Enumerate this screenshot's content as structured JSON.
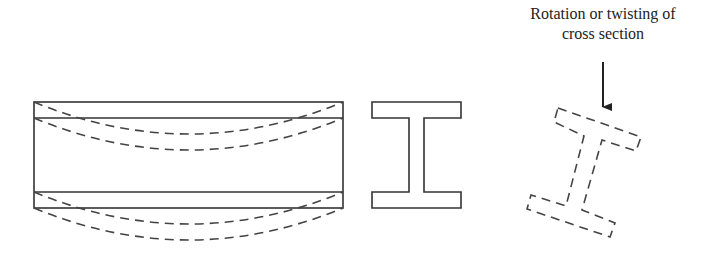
{
  "figure": {
    "annotation": {
      "line1": "Rotation or twisting of",
      "line2": "cross section"
    },
    "parts": [
      {
        "name": "beam-side-view",
        "style": "solid outline with dashed deflected flange curves"
      },
      {
        "name": "original-cross-section",
        "style": "solid I-shape"
      },
      {
        "name": "twisted-cross-section",
        "style": "dashed rotated I-shape"
      }
    ],
    "colors": {
      "line": "#333333",
      "background": "#ffffff"
    }
  }
}
